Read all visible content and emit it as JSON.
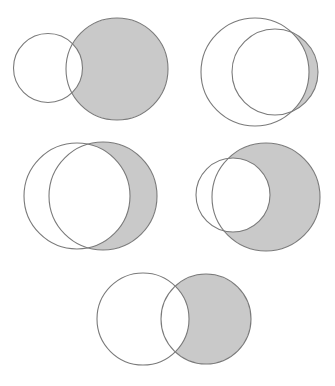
{
  "canvas": {
    "width": 335,
    "height": 386,
    "background": "#ffffff"
  },
  "style": {
    "shade_fill": "#c9c9c9",
    "stroke": "#7a7a7a",
    "stroke_width": 1.1
  },
  "diagrams": [
    {
      "id": "diagram-1",
      "description": "B minus A (large right circle shaded, excluding overlap with small left circle)",
      "circle_a": {
        "cx": 48,
        "cy": 68,
        "r": 34.5
      },
      "circle_b": {
        "cx": 117,
        "cy": 69,
        "r": 51
      },
      "shaded": "B-A"
    },
    {
      "id": "diagram-2",
      "description": "B minus A (thin crescent of inner right circle outside large left circle)",
      "circle_a": {
        "cx": 255,
        "cy": 72,
        "r": 54
      },
      "circle_b": {
        "cx": 275,
        "cy": 72,
        "r": 43
      },
      "shaded": "B-A"
    },
    {
      "id": "diagram-3",
      "description": "B minus A (right circle shaded outside left circle)",
      "circle_a": {
        "cx": 77,
        "cy": 196,
        "r": 53
      },
      "circle_b": {
        "cx": 103,
        "cy": 196,
        "r": 54
      },
      "shaded": "B-A"
    },
    {
      "id": "diagram-4",
      "description": "B minus A (large right circle shaded excluding small left circle)",
      "circle_a": {
        "cx": 233,
        "cy": 195,
        "r": 37
      },
      "circle_b": {
        "cx": 266,
        "cy": 197,
        "r": 54
      },
      "shaded": "B-A"
    },
    {
      "id": "diagram-5",
      "description": "B minus A (right circle shaded outside left circle)",
      "circle_a": {
        "cx": 143,
        "cy": 319,
        "r": 46
      },
      "circle_b": {
        "cx": 206,
        "cy": 319,
        "r": 45
      },
      "shaded": "B-A"
    }
  ]
}
